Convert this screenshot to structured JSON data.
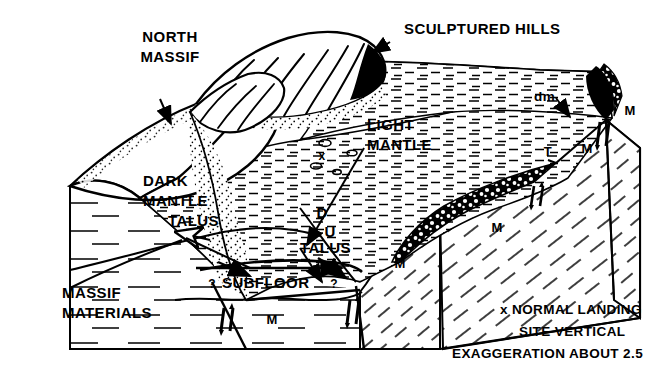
{
  "figure": {
    "kind": "geologic-block-diagram",
    "ink_color": "#000000",
    "paper_color": "#ffffff"
  },
  "labels": {
    "north_massif": "NORTH\nMASSIF",
    "north_massif_line1": "NORTH",
    "north_massif_line2": "MASSIF",
    "sculptured_hills": "SCULPTURED HILLS",
    "light_mantle_line1": "LIGHT",
    "light_mantle_line2": "MANTLE",
    "dark_mantle_line1": "DARK",
    "dark_mantle_line2": "MANTLE",
    "dark_mantle_line3": "TALUS",
    "talus": "TALUS",
    "subfloor": "SUBFLOOR",
    "massif_materials_line1": "MASSIF",
    "massif_materials_line2": "MATERIALS",
    "dm": "dm",
    "fault_down": "D",
    "fault_up": "U",
    "query_left": "?",
    "query_right": "?",
    "landing_site_marker": "x"
  },
  "unit_symbols": {
    "massif": "M",
    "talus_unit": "T",
    "instances": [
      {
        "symbol": "M",
        "x": 630,
        "y": 115
      },
      {
        "symbol": "M",
        "x": 587,
        "y": 153
      },
      {
        "symbol": "M",
        "x": 497,
        "y": 232
      },
      {
        "symbol": "M",
        "x": 400,
        "y": 268
      },
      {
        "symbol": "M",
        "x": 272,
        "y": 324
      },
      {
        "symbol": "T",
        "x": 609,
        "y": 104
      },
      {
        "symbol": "T",
        "x": 548,
        "y": 156
      }
    ]
  },
  "legend": {
    "line1": "x NORMAL LANDING",
    "line2": "SITE     VERTICAL",
    "line3": "EXAGGERATION ABOUT 2.5",
    "marker": "x",
    "marker_meaning": "NORMAL LANDING SITE",
    "vertical_exaggeration": "2.5"
  }
}
